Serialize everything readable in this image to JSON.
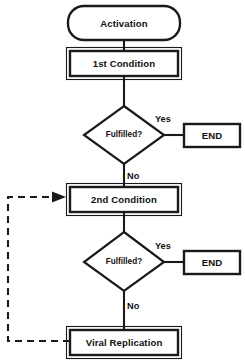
{
  "diagram": {
    "type": "flowchart",
    "background_color": "#ffffff",
    "line_color": "#1a1a1a",
    "text_color": "#111111"
  },
  "nodes": {
    "activation": {
      "label": "Activation",
      "shape": "rounded-rectangle"
    },
    "first_condition": {
      "label": "1st Condition",
      "shape": "rectangle"
    },
    "first_decision": {
      "label": "Fulfilled?",
      "shape": "diamond"
    },
    "first_end": {
      "label": "END",
      "shape": "rectangle"
    },
    "second_condition": {
      "label": "2nd Condition",
      "shape": "rectangle"
    },
    "second_decision": {
      "label": "Fulfilled?",
      "shape": "diamond"
    },
    "second_end": {
      "label": "END",
      "shape": "rectangle"
    },
    "viral_replication": {
      "label": "Viral Replication",
      "shape": "rectangle"
    }
  },
  "edges": {
    "first_yes": {
      "label": "Yes"
    },
    "first_no": {
      "label": "No"
    },
    "second_yes": {
      "label": "Yes"
    },
    "second_no": {
      "label": "No"
    },
    "feedback_loop": {
      "label": "",
      "style": "dashed"
    }
  }
}
